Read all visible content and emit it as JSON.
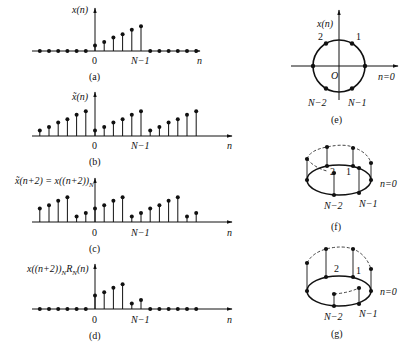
{
  "figure": {
    "panels": [
      {
        "id": "a",
        "caption": "(a)",
        "ylabel": "x(n)",
        "xlabel": "n",
        "tick_zero": "0",
        "tick_end": "N−1",
        "n_start": -6,
        "values": [
          0,
          0,
          0,
          0,
          0,
          0,
          1,
          1.6,
          2.4,
          3,
          3.8,
          4.4,
          0,
          0,
          0,
          0,
          0,
          0
        ]
      },
      {
        "id": "b",
        "caption": "(b)",
        "ylabel": "x̃(n)",
        "xlabel": "n",
        "tick_zero": "0",
        "tick_end": "N−1",
        "n_start": -6,
        "values": [
          1,
          1.6,
          2.4,
          3,
          3.8,
          4.4,
          1,
          1.6,
          2.4,
          3,
          3.8,
          4.4,
          1,
          1.6,
          2.4,
          3,
          3.8,
          4.4
        ]
      },
      {
        "id": "c",
        "caption": "(c)",
        "ylabel": "x̃(n+2) = x((n+2))",
        "ylabel_sub": "N",
        "xlabel": "n",
        "tick_zero": "0",
        "tick_end": "N−1",
        "n_start": -6,
        "values": [
          2.4,
          3,
          3.8,
          4.4,
          1,
          1.6,
          2.4,
          3,
          3.8,
          4.4,
          1,
          1.6,
          2.4,
          3,
          3.8,
          4.4,
          1,
          1.6
        ]
      },
      {
        "id": "d",
        "caption": "(d)",
        "ylabel": "x((n+2))",
        "ylabel_sub": "N",
        "ylabel_tail": "R",
        "ylabel_tail_sub": "N",
        "ylabel_end": "(n)",
        "xlabel": "n",
        "tick_zero": "0",
        "tick_end": "N−1",
        "n_start": -6,
        "values": [
          0,
          0,
          0,
          0,
          0,
          0,
          2.4,
          3,
          3.8,
          4.4,
          1,
          1.6,
          0,
          0,
          0,
          0,
          0,
          0
        ]
      }
    ],
    "circle_panels": {
      "e": {
        "caption": "(e)",
        "ylabel": "x(n)",
        "origin": "O",
        "point_labels": {
          "p0": "n=0",
          "p1": "1",
          "p2": "2",
          "pNm1": "N−1",
          "pNm2": "N−2"
        }
      },
      "f": {
        "caption": "(f)",
        "point_labels": {
          "p0": "n=0",
          "p1": "1",
          "p2": "2",
          "pNm1": "N−1",
          "pNm2": "N−2"
        }
      },
      "g": {
        "caption": "(g)",
        "point_labels": {
          "p0": "n=0",
          "p1": "1",
          "p2": "2",
          "pNm1": "N−1",
          "pNm2": "N−2"
        }
      }
    }
  }
}
